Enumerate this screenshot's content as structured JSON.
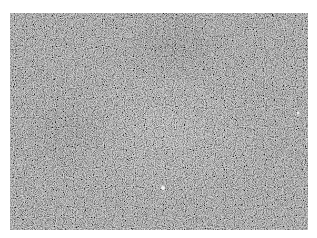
{
  "image": {
    "description": "Grayscale noisy granular texture resembling a microscopy image, with a brighter central region and darker streaks toward the upper middle and left",
    "colors": {
      "base": "#7a7a7a",
      "light": "#bdbdbd",
      "dark": "#3a3a3a",
      "highlight": "#f0f0f0"
    }
  }
}
